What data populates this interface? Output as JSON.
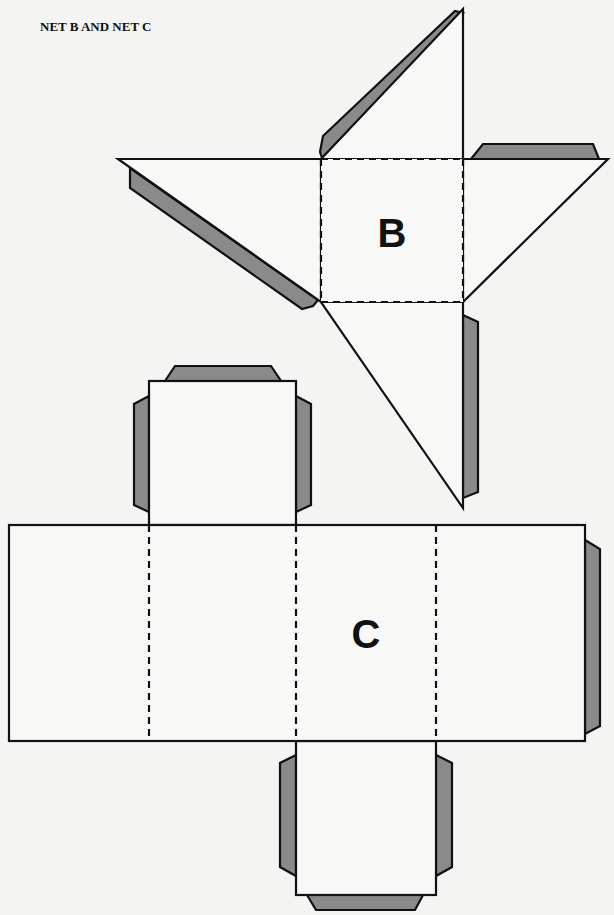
{
  "title": "NET B AND NET C",
  "nets": [
    {
      "label": "B",
      "shape": "square pyramid net",
      "faces": [
        "square base",
        "top triangle",
        "left triangle",
        "right triangle",
        "bottom triangle"
      ],
      "glue_tabs": 4
    },
    {
      "label": "C",
      "shape": "rectangular prism net",
      "faces": [
        "strip of 4 rectangles",
        "top square",
        "bottom square"
      ],
      "glue_tabs": 7
    }
  ],
  "colors": {
    "line": "#111111",
    "tab_fill": "#8a8a8a",
    "face_fill": "#f8f8f6",
    "background": "#f4f4f2"
  }
}
